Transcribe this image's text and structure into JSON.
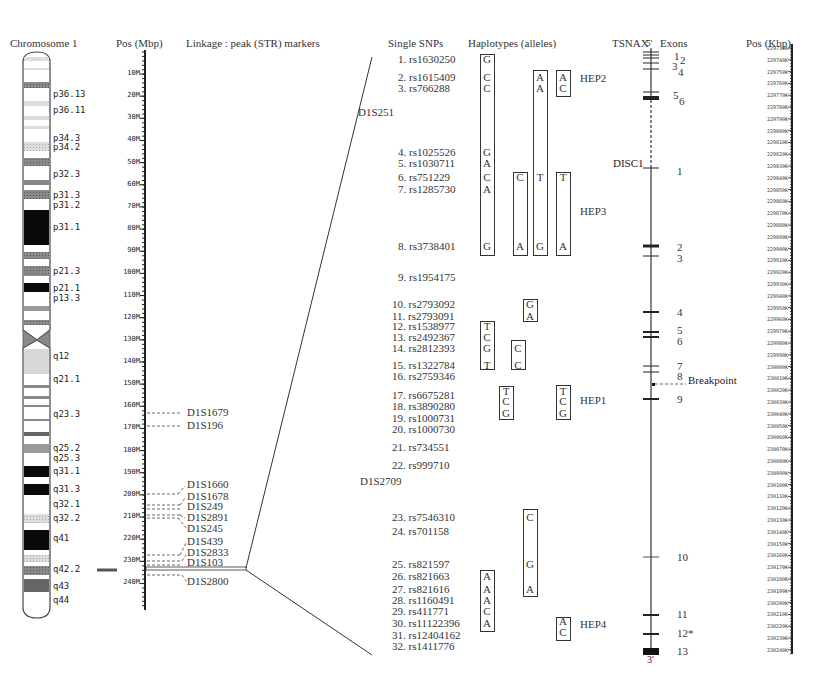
{
  "headers": {
    "chromosome": "Chromosome 1",
    "pos_mbp": "Pos (Mbp)",
    "linkage": "Linkage : peak (STR) markers",
    "single_snps": "Single SNPs",
    "haplotypes": "Haplotypes (alleles)",
    "gene": "TSNAX",
    "exons": "Exons",
    "pos_kbp": "Pos (Kbp)"
  },
  "bands": [
    {
      "label": "p36.13",
      "y": 95
    },
    {
      "label": "p36.11",
      "y": 111
    },
    {
      "label": "p34.3",
      "y": 139
    },
    {
      "label": "p34.2",
      "y": 148
    },
    {
      "label": "p32.3",
      "y": 175
    },
    {
      "label": "p31.3",
      "y": 196
    },
    {
      "label": "p31.2",
      "y": 206
    },
    {
      "label": "p31.1",
      "y": 228
    },
    {
      "label": "p21.3",
      "y": 272
    },
    {
      "label": "p21.1",
      "y": 289
    },
    {
      "label": "p13.3",
      "y": 299
    },
    {
      "label": "q12",
      "y": 357
    },
    {
      "label": "q21.1",
      "y": 380
    },
    {
      "label": "q23.3",
      "y": 415
    },
    {
      "label": "q25.2",
      "y": 449
    },
    {
      "label": "q25.3",
      "y": 459
    },
    {
      "label": "q31.1",
      "y": 472
    },
    {
      "label": "q31.3",
      "y": 490
    },
    {
      "label": "q32.1",
      "y": 505
    },
    {
      "label": "q32.2",
      "y": 519
    },
    {
      "label": "q41",
      "y": 539
    },
    {
      "label": "q42.2",
      "y": 570
    },
    {
      "label": "q43",
      "y": 587
    },
    {
      "label": "q44",
      "y": 601
    }
  ],
  "mbp_ticks": [
    "10M",
    "20M",
    "30M",
    "40M",
    "50M",
    "60M",
    "70M",
    "80M",
    "90M",
    "100M",
    "110M",
    "120M",
    "130M",
    "140M",
    "150M",
    "160M",
    "170M",
    "180M",
    "190M",
    "200M",
    "210M",
    "220M",
    "230M",
    "240M"
  ],
  "str_markers": [
    {
      "name": "D1S1679",
      "y": 413
    },
    {
      "name": "D1S196",
      "y": 426
    },
    {
      "name": "D1S1660",
      "y": 485
    },
    {
      "name": "D1S1678",
      "y": 497
    },
    {
      "name": "D1S249",
      "y": 507
    },
    {
      "name": "D1S2891",
      "y": 518
    },
    {
      "name": "D1S245",
      "y": 529
    },
    {
      "name": "D1S439",
      "y": 542
    },
    {
      "name": "D1S2833",
      "y": 553
    },
    {
      "name": "D1S103",
      "y": 563
    },
    {
      "name": "D1S2800",
      "y": 582
    }
  ],
  "region_markers": [
    {
      "name": "D1S251",
      "x": 358,
      "y": 113
    },
    {
      "name": "D1S2709",
      "x": 360,
      "y": 482
    }
  ],
  "snps": [
    {
      "label": "1. rs1630250",
      "y": 60
    },
    {
      "label": "2. rs1615409",
      "y": 78
    },
    {
      "label": "3. rs766288",
      "y": 89
    },
    {
      "label": "4. rs1025526",
      "y": 153
    },
    {
      "label": "5. rs1030711",
      "y": 164
    },
    {
      "label": "6. rs751229",
      "y": 178
    },
    {
      "label": "7. rs1285730",
      "y": 190
    },
    {
      "label": "8. rs3738401",
      "y": 247
    },
    {
      "label": "9. rs1954175",
      "y": 278
    },
    {
      "label": "10. rs2793092",
      "y": 305
    },
    {
      "label": "11. rs2793091",
      "y": 317
    },
    {
      "label": "12. rs1538977",
      "y": 327
    },
    {
      "label": "13. rs2492367",
      "y": 338
    },
    {
      "label": "14. rs2812393",
      "y": 349
    },
    {
      "label": "15. rs1322784",
      "y": 366
    },
    {
      "label": "16. rs2759346",
      "y": 377
    },
    {
      "label": "17. rs6675281",
      "y": 396
    },
    {
      "label": "18. rs3890280",
      "y": 407
    },
    {
      "label": "19. rs1000731",
      "y": 419
    },
    {
      "label": "20. rs1000730",
      "y": 430
    },
    {
      "label": "21. rs734551",
      "y": 448
    },
    {
      "label": "22. rs999710",
      "y": 466
    },
    {
      "label": "23. rs7546310",
      "y": 518
    },
    {
      "label": "24. rs701158",
      "y": 532
    },
    {
      "label": "25. rs821597",
      "y": 565
    },
    {
      "label": "26. rs821663",
      "y": 577
    },
    {
      "label": "27. rs821616",
      "y": 590
    },
    {
      "label": "28. rs1160491",
      "y": 601
    },
    {
      "label": "29. rs411771",
      "y": 612
    },
    {
      "label": "30. rs11122396",
      "y": 624
    },
    {
      "label": "31. rs12404162",
      "y": 636
    },
    {
      "label": "32. rs1411776",
      "y": 647
    }
  ],
  "haplotype_boxes": [
    {
      "x": 480,
      "top": 54,
      "bottom": 256,
      "alleles": [
        {
          "a": "G",
          "y": 60
        },
        {
          "a": "C",
          "y": 78
        },
        {
          "a": "C",
          "y": 89
        },
        {
          "a": "G",
          "y": 153
        },
        {
          "a": "A",
          "y": 164
        },
        {
          "a": "C",
          "y": 178
        },
        {
          "a": "A",
          "y": 190
        },
        {
          "a": "G",
          "y": 247
        }
      ]
    },
    {
      "x": 533,
      "top": 70,
      "bottom": 256,
      "alleles": [
        {
          "a": "A",
          "y": 78
        },
        {
          "a": "A",
          "y": 89
        },
        {
          "a": "T",
          "y": 178
        },
        {
          "a": "G",
          "y": 247
        }
      ]
    },
    {
      "x": 556,
      "top": 70,
      "bottom": 97,
      "alleles": [
        {
          "a": "A",
          "y": 78
        },
        {
          "a": "C",
          "y": 89
        }
      ]
    },
    {
      "x": 513,
      "top": 172,
      "bottom": 256,
      "alleles": [
        {
          "a": "C",
          "y": 178
        },
        {
          "a": "A",
          "y": 247
        }
      ]
    },
    {
      "x": 556,
      "top": 172,
      "bottom": 256,
      "alleles": [
        {
          "a": "T",
          "y": 178
        },
        {
          "a": "A",
          "y": 247
        }
      ]
    },
    {
      "x": 523,
      "top": 299,
      "bottom": 322,
      "alleles": [
        {
          "a": "G",
          "y": 305
        },
        {
          "a": "A",
          "y": 317
        }
      ]
    },
    {
      "x": 480,
      "top": 321,
      "bottom": 370,
      "alleles": [
        {
          "a": "T",
          "y": 327
        },
        {
          "a": "C",
          "y": 338
        },
        {
          "a": "G",
          "y": 349
        },
        {
          "a": "T",
          "y": 366
        }
      ]
    },
    {
      "x": 511,
      "top": 340,
      "bottom": 370,
      "alleles": [
        {
          "a": "C",
          "y": 349
        },
        {
          "a": "C",
          "y": 366
        }
      ]
    },
    {
      "x": 499,
      "top": 386,
      "bottom": 420,
      "alleles": [
        {
          "a": "T",
          "y": 392
        },
        {
          "a": "C",
          "y": 402
        },
        {
          "a": "G",
          "y": 414
        }
      ]
    },
    {
      "x": 556,
      "top": 385,
      "bottom": 420,
      "alleles": [
        {
          "a": "T",
          "y": 392
        },
        {
          "a": "C",
          "y": 402
        },
        {
          "a": "G",
          "y": 414
        }
      ]
    },
    {
      "x": 523,
      "top": 509,
      "bottom": 597,
      "alleles": [
        {
          "a": "C",
          "y": 518
        },
        {
          "a": "G",
          "y": 565
        },
        {
          "a": "A",
          "y": 590
        }
      ]
    },
    {
      "x": 480,
      "top": 570,
      "bottom": 632,
      "alleles": [
        {
          "a": "A",
          "y": 577
        },
        {
          "a": "A",
          "y": 590
        },
        {
          "a": "A",
          "y": 601
        },
        {
          "a": "C",
          "y": 612
        },
        {
          "a": "A",
          "y": 624
        }
      ]
    },
    {
      "x": 556,
      "top": 617,
      "bottom": 641,
      "alleles": [
        {
          "a": "A",
          "y": 622
        },
        {
          "a": "C",
          "y": 633
        }
      ]
    }
  ],
  "hep_labels": [
    {
      "label": "HEP2",
      "x": 580,
      "y": 76
    },
    {
      "label": "HEP3",
      "x": 580,
      "y": 209
    },
    {
      "label": "HEP1",
      "x": 580,
      "y": 398
    },
    {
      "label": "HEP4",
      "x": 580,
      "y": 622
    }
  ],
  "gene": {
    "five_prime": "5'",
    "three_prime": "3'",
    "second_gene": "DISC1",
    "breakpoint": "Breakpoint"
  },
  "exons": [
    {
      "label": "1",
      "y": 50,
      "label_x": 674,
      "tick_y": [
        52,
        55
      ]
    },
    {
      "label": "2",
      "y": 54,
      "label_x": 680,
      "tick_y": [
        58
      ]
    },
    {
      "label": "3",
      "y": 60,
      "label_x": 672,
      "tick_y": [
        63
      ]
    },
    {
      "label": "4",
      "y": 66,
      "label_x": 678,
      "tick_y": [
        69
      ]
    },
    {
      "label": "5",
      "y": 89,
      "label_x": 673,
      "tick_y": [
        92
      ]
    },
    {
      "label": "6",
      "y": 95,
      "label_x": 679,
      "tick_y": [
        97,
        99
      ]
    },
    {
      "label": "1",
      "y": 165,
      "label_x": 677,
      "tick_y": [
        168
      ]
    },
    {
      "label": "2",
      "y": 241,
      "label_x": 677,
      "tick_y": [
        246
      ]
    },
    {
      "label": "3",
      "y": 252,
      "label_x": 677,
      "tick_y": [
        256
      ]
    },
    {
      "label": "4",
      "y": 306,
      "label_x": 677,
      "tick_y": [
        312
      ]
    },
    {
      "label": "5",
      "y": 324,
      "label_x": 677,
      "tick_y": [
        331,
        336
      ]
    },
    {
      "label": "6",
      "y": 335,
      "label_x": 677,
      "tick_y": []
    },
    {
      "label": "7",
      "y": 360,
      "label_x": 677,
      "tick_y": [
        366
      ]
    },
    {
      "label": "8",
      "y": 370,
      "label_x": 677,
      "tick_y": [
        372
      ]
    },
    {
      "label": "9",
      "y": 393,
      "label_x": 677,
      "tick_y": [
        399
      ]
    },
    {
      "label": "10",
      "y": 551,
      "label_x": 677,
      "tick_y": [
        557
      ]
    },
    {
      "label": "11",
      "y": 608,
      "label_x": 677,
      "tick_y": [
        615
      ]
    },
    {
      "label": "12*",
      "y": 627,
      "label_x": 677,
      "tick_y": [
        634
      ]
    },
    {
      "label": "13",
      "y": 645,
      "label_x": 677,
      "tick_y": [
        651
      ]
    }
  ],
  "kbp_ticks": [
    "229730K",
    "229740K",
    "229750K",
    "229760K",
    "229770K",
    "229780K",
    "229790K",
    "229800K",
    "229810K",
    "229820K",
    "229830K",
    "229840K",
    "229850K",
    "229860K",
    "229870K",
    "229880K",
    "229890K",
    "229900K",
    "229910K",
    "229920K",
    "229930K",
    "229940K",
    "229950K",
    "229960K",
    "229970K",
    "229980K",
    "229990K",
    "230000K",
    "230010K",
    "230020K",
    "230030K",
    "230040K",
    "230050K",
    "230060K",
    "230070K",
    "230080K",
    "230090K",
    "230100K",
    "230110K",
    "230120K",
    "230130K",
    "230140K",
    "230150K",
    "230160K",
    "230170K",
    "230180K",
    "230190K",
    "230200K",
    "230210K",
    "230220K",
    "230230K",
    "230240K"
  ],
  "colors": {
    "line": "#333333",
    "band_dark": "#111111",
    "band_mid": "#7a7a7a",
    "band_light": "#c8c8c8"
  }
}
